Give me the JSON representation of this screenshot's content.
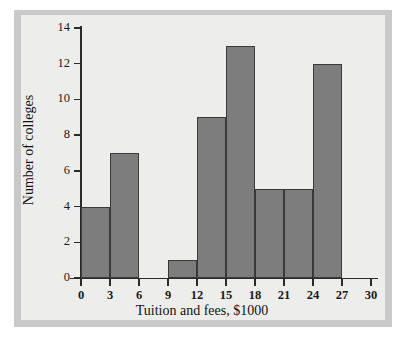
{
  "chart_data": {
    "type": "bar",
    "title": "",
    "subtitle": "",
    "xlabel": "Tuition and fees, $1000",
    "ylabel": "Number of colleges",
    "bin_width": 3,
    "bin_edges": [
      0,
      3,
      6,
      9,
      12,
      15,
      18,
      21,
      24,
      27,
      30
    ],
    "categories": [
      "0-3",
      "3-6",
      "6-9",
      "9-12",
      "12-15",
      "15-18",
      "18-21",
      "21-24",
      "24-27",
      "27-30"
    ],
    "values": [
      4,
      7,
      0,
      1,
      9,
      13,
      5,
      5,
      12,
      0
    ],
    "xlim": [
      0,
      30
    ],
    "ylim": [
      0,
      14
    ],
    "xticks": [
      0,
      3,
      6,
      9,
      12,
      15,
      18,
      21,
      24,
      27,
      30
    ],
    "yticks": [
      0,
      2,
      4,
      6,
      8,
      10,
      12,
      14
    ],
    "xtick_labels": [
      "0",
      "3",
      "6",
      "9",
      "12",
      "15",
      "18",
      "21",
      "24",
      "27",
      "30"
    ],
    "ytick_labels": [
      "0",
      "2",
      "4",
      "6",
      "8",
      "10",
      "12",
      "14"
    ],
    "grid": false,
    "legend": null,
    "annotations": [],
    "colors": {
      "bar_fill": "#7d7d7d",
      "bar_edge": "#3a3a3a",
      "axis": "#2b2b2b",
      "panel_background": "#ededeb",
      "figure_margin": "#c9c9c9",
      "text": "#121212"
    }
  }
}
